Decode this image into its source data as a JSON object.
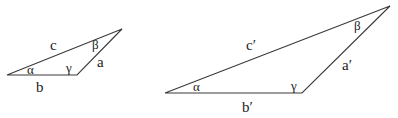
{
  "diagram": {
    "triangles": [
      {
        "id": "small",
        "vertices": {
          "A": [
            7,
            75
          ],
          "C": [
            77,
            75
          ],
          "B": [
            122,
            29
          ]
        },
        "sides": {
          "a": "a",
          "b": "b",
          "c": "c"
        },
        "angles": {
          "alpha": "α",
          "beta": "β",
          "gamma": "γ"
        }
      },
      {
        "id": "large",
        "vertices": {
          "A": [
            165,
            93
          ],
          "C": [
            302,
            93
          ],
          "B": [
            390,
            6
          ]
        },
        "sides": {
          "a": "a′",
          "b": "b′",
          "c": "c′"
        },
        "angles": {
          "alpha": "α",
          "beta": "β",
          "gamma": "γ"
        }
      }
    ],
    "colors": {
      "stroke": "#3a3a3a",
      "text": "#222222",
      "background": "#ffffff"
    }
  }
}
